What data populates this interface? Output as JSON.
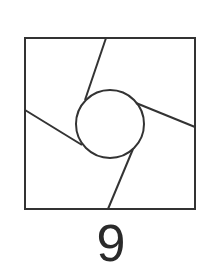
{
  "figure": {
    "label": "9",
    "stroke_color": "#333333",
    "background": "#ffffff",
    "square": {
      "x1": 25,
      "y1": 38,
      "x2": 195,
      "y2": 209
    },
    "circle": {
      "cx": 110,
      "cy": 124,
      "r": 34
    },
    "lines": [
      {
        "id": "top",
        "x1": 106,
        "y1": 38,
        "x2": 85,
        "y2": 100
      },
      {
        "id": "right",
        "x1": 195,
        "y1": 127,
        "x2": 136,
        "y2": 103
      },
      {
        "id": "bottom",
        "x1": 108,
        "y1": 209,
        "x2": 133,
        "y2": 149
      },
      {
        "id": "left",
        "x1": 25,
        "y1": 110,
        "x2": 82,
        "y2": 145
      }
    ]
  }
}
